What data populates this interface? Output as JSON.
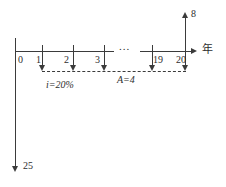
{
  "diagram": {
    "kind": "cash-flow-diagram",
    "axis": {
      "unit_label": "年",
      "ellipsis": "...",
      "tick_labels": [
        "0",
        "1",
        "2",
        "3",
        "19",
        "20"
      ]
    },
    "annotations": {
      "interest_rate": "i=20%",
      "annuity": "A=4"
    },
    "arrows": {
      "up_at_year_20": "8",
      "down_at_year_0": "25",
      "down_annuity_years": [
        "1",
        "2",
        "3",
        "19",
        "20"
      ]
    },
    "colors": {
      "line": "#3b3b3b",
      "text": "#2e2e2e",
      "background": "#ffffff"
    }
  }
}
